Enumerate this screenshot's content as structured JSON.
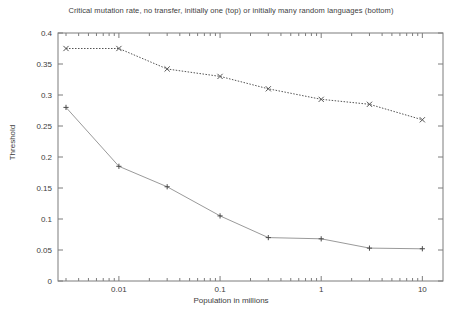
{
  "chart_data": {
    "type": "line",
    "title": "Critical mutation rate, no transfer, initially one (top) or initially many random languages (bottom)",
    "xlabel": "Population in millions",
    "ylabel": "Threshold",
    "xscale": "log",
    "xlim": [
      0.0025,
      16
    ],
    "ylim": [
      0,
      0.4
    ],
    "grid": false,
    "legend": "none",
    "ytick_labels": [
      "0",
      "0.05",
      "0.1",
      "0.15",
      "0.2",
      "0.25",
      "0.3",
      "0.35",
      "0.4"
    ],
    "ytick_values": [
      0,
      0.05,
      0.1,
      0.15,
      0.2,
      0.25,
      0.3,
      0.35,
      0.4
    ],
    "xtick_labels": [
      "0.01",
      "0.1",
      "1",
      "10"
    ],
    "xtick_values": [
      0.01,
      0.1,
      1,
      10
    ],
    "series": [
      {
        "name": "initially one language (top)",
        "marker": "x",
        "linestyle": "dotted",
        "color": "#555555",
        "x": [
          0.003,
          0.01,
          0.03,
          0.1,
          0.3,
          1,
          3,
          10
        ],
        "y": [
          0.375,
          0.375,
          0.342,
          0.33,
          0.31,
          0.293,
          0.285,
          0.26
        ]
      },
      {
        "name": "initially many random languages (bottom)",
        "marker": "+",
        "linestyle": "solid",
        "color": "#9a9a9a",
        "x": [
          0.003,
          0.01,
          0.03,
          0.1,
          0.3,
          1,
          3,
          10
        ],
        "y": [
          0.28,
          0.185,
          0.152,
          0.105,
          0.07,
          0.068,
          0.053,
          0.052
        ]
      }
    ]
  }
}
